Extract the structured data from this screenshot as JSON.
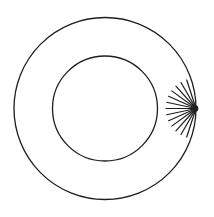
{
  "figure": {
    "kind": "concentric-circles-with-ray-fan",
    "background_color": "#ffffff",
    "stroke_color": "#1e1e1e",
    "canvas": {
      "width": 214,
      "height": 217
    },
    "circles": [
      {
        "name": "outer-circle",
        "cx": 105,
        "cy": 108.5,
        "r": 91,
        "stroke_width": 1.3
      },
      {
        "name": "inner-circle",
        "cx": 105,
        "cy": 108.5,
        "r": 52.5,
        "stroke_width": 1.3
      }
    ],
    "ray_fan": {
      "origin": {
        "x": 196,
        "y": 108.5
      },
      "ray_count": 13,
      "angles_deg": [
        108,
        120,
        132,
        144,
        156,
        168,
        180,
        192,
        204,
        216,
        228,
        240,
        252
      ],
      "length": 30,
      "stroke_width": 1.2,
      "hub": {
        "rx": 2.8,
        "ry": 3.2
      }
    }
  }
}
